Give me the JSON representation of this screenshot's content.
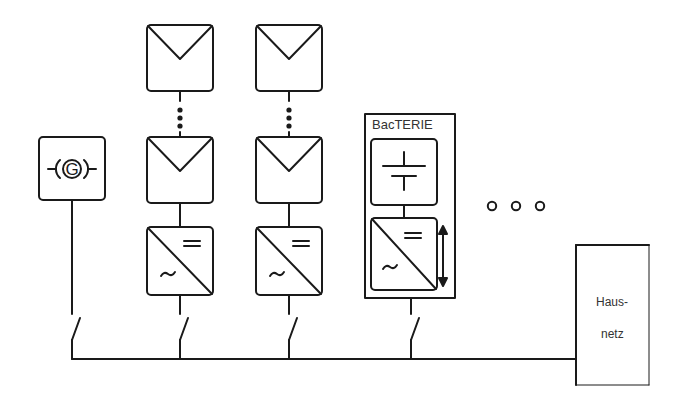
{
  "diagram": {
    "type": "electrical single-line diagram",
    "colors": {
      "stroke": "#1a1a1a",
      "text": "#333333",
      "background": "#ffffff"
    },
    "generator": {
      "symbol_text": "G",
      "icon": "generator-icon"
    },
    "pv_strings": [
      {
        "modules_icon": "solar-panel-icon",
        "ellipsis": "vertical-dots",
        "inverter_icon": "dc-ac-inverter-icon"
      },
      {
        "modules_icon": "solar-panel-icon",
        "ellipsis": "vertical-dots",
        "inverter_icon": "dc-ac-inverter-icon"
      }
    ],
    "battery_system": {
      "title": "BacTERIE",
      "battery_icon": "battery-icon",
      "inverter_icon": "bidirectional-inverter-icon",
      "flow_icon": "double-arrow-icon"
    },
    "more_indicator": "o o o",
    "house_grid": {
      "line1": "Haus-",
      "line2": "netz"
    },
    "switches": 4
  }
}
